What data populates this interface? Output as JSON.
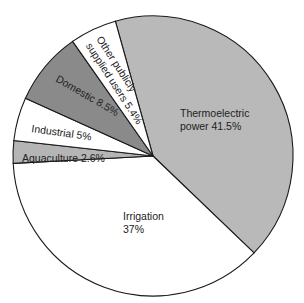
{
  "chart_data": {
    "type": "pie",
    "title": "",
    "start_angle_deg": 254.4,
    "direction": "clockwise",
    "center": [
      153,
      156
    ],
    "radius": 140,
    "slices": [
      {
        "name": "Thermoelectric power",
        "value": 41.5,
        "color": "#b9b9b9",
        "label_lines": [
          "Thermoelectric",
          "power 41.5%"
        ],
        "label_pos": [
          180,
          117
        ],
        "label_rot": 0
      },
      {
        "name": "Irrigation",
        "value": 37.0,
        "color": "#ffffff",
        "label_lines": [
          "Irrigation",
          "37%"
        ],
        "label_pos": [
          123,
          220
        ],
        "label_rot": 0
      },
      {
        "name": "Aquaculture",
        "value": 2.6,
        "color": "#b5b5b5",
        "label_lines": [
          "Aquaculture 2.6%"
        ],
        "label_pos": [
          22,
          162
        ],
        "label_rot": 0
      },
      {
        "name": "Industrial",
        "value": 5.0,
        "color": "#ffffff",
        "label_lines": [
          "Industrial 5%"
        ],
        "label_pos": [
          31,
          132
        ],
        "label_rot": 8
      },
      {
        "name": "Domestic",
        "value": 8.5,
        "color": "#8a8a8a",
        "label_lines": [
          "Domestic  8.5%"
        ],
        "label_pos": [
          55,
          81
        ],
        "label_rot": 30
      },
      {
        "name": "Other publicly supplied users",
        "value": 5.4,
        "color": "#ffffff",
        "label_lines": [
          "Other publicly",
          "supplied users 5.4%"
        ],
        "label_pos": [
          96,
          39
        ],
        "label_rot": 57
      }
    ]
  }
}
